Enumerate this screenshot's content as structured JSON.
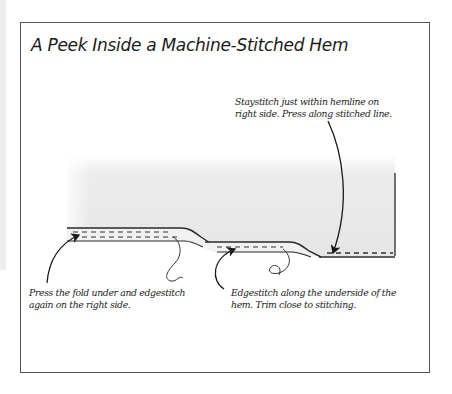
{
  "figure": {
    "title": "A Peek Inside a Machine-Stitched Hem",
    "callouts": [
      {
        "id": "staystitch",
        "lines": [
          "Staystitch just within hemline on",
          "right side. Press along stitched line."
        ]
      },
      {
        "id": "press-fold",
        "lines": [
          "Press the fold under and edgestitch",
          "again on the right side."
        ]
      },
      {
        "id": "edgestitch",
        "lines": [
          "Edgestitch along the underside of the",
          "hem. Trim close to stitching."
        ]
      }
    ],
    "colors": {
      "frame": "#555555",
      "fabric": "#e9e9e9",
      "outline": "#2a2a2a",
      "stitch": "#333333"
    }
  }
}
